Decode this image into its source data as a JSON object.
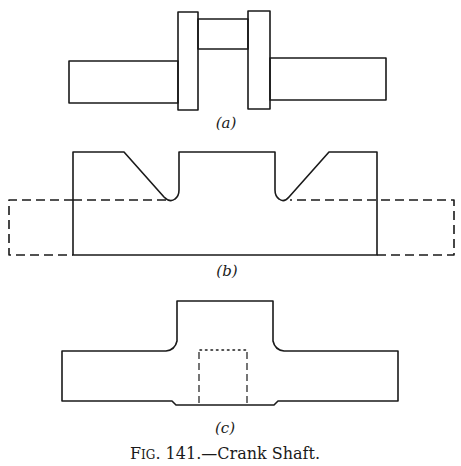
{
  "figure": {
    "number": "141",
    "caption_prefix_F": "F",
    "caption_prefix_rest": "IG",
    "caption_number": ". 141.",
    "caption_title": "—Crank Shaft.",
    "subfigures": [
      {
        "label": "(a)",
        "description": "Finished crank shaft: two shaft ends, two crank webs, crankpin"
      },
      {
        "label": "(b)",
        "description": "Forging outline with dashed rough stock bar"
      },
      {
        "label": "(c)",
        "description": "Shaft with central boss and dashed hidden bore"
      }
    ]
  },
  "colors": {
    "line": "#1a1a1a",
    "background": "#ffffff"
  }
}
